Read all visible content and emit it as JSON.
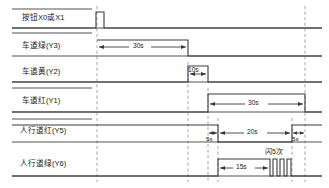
{
  "diagram": {
    "type": "timing-diagram",
    "signals": [
      {
        "id": "X0X1",
        "label": "按钮X0或X1",
        "row": 0
      },
      {
        "id": "Y3",
        "label": "车道绿(Y3)",
        "row": 1
      },
      {
        "id": "Y2",
        "label": "车道黄(Y2)",
        "row": 2
      },
      {
        "id": "Y1",
        "label": "车道红(Y1)",
        "row": 3
      },
      {
        "id": "Y5",
        "label": "人行道红(Y5)",
        "row": 4
      },
      {
        "id": "Y6",
        "label": "人行道绿(Y6)",
        "row": 5
      }
    ],
    "dimensions": [
      {
        "id": "d-y3-30s",
        "text": "30s",
        "signal": "Y3"
      },
      {
        "id": "d-y2-10s",
        "text": "10s",
        "signal": "Y2"
      },
      {
        "id": "d-y1-30s",
        "text": "30s",
        "signal": "Y1"
      },
      {
        "id": "d-y5-5s-a",
        "text": "5s",
        "signal": "Y5"
      },
      {
        "id": "d-y5-20s",
        "text": "20s",
        "signal": "Y5"
      },
      {
        "id": "d-y5-5s-b",
        "text": "5s",
        "signal": "Y5"
      },
      {
        "id": "d-y6-15s",
        "text": "15s",
        "signal": "Y6"
      }
    ],
    "annotations": [
      {
        "id": "a-flash",
        "text": "闪5次",
        "signal": "Y6"
      }
    ],
    "colors": {
      "line": "#3a3a3a",
      "baseline": "#555555",
      "dashed": "#8a8a8a",
      "text": "#1a1a1a",
      "background": "#ffffff"
    }
  }
}
